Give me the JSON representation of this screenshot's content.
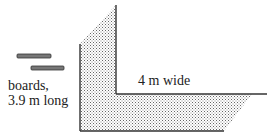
{
  "diagram": {
    "boards_label_line1": "boards,",
    "boards_label_line2": "3.9 m long",
    "width_label": "4 m wide",
    "colors": {
      "line": "#333333",
      "board_fill": "#777777",
      "shade_dot": "#555555"
    }
  }
}
